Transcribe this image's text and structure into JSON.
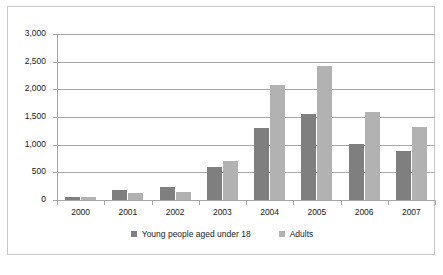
{
  "chart_data": {
    "type": "bar",
    "title": "",
    "subtitle": "",
    "xlabel": "",
    "ylabel": "",
    "categories": [
      "2000",
      "2001",
      "2002",
      "2003",
      "2004",
      "2005",
      "2006",
      "2007"
    ],
    "series": [
      {
        "name": "Young people aged under 18",
        "color": "#7f7f7f",
        "values": [
          60,
          180,
          235,
          605,
          1310,
          1555,
          1015,
          890
        ]
      },
      {
        "name": "Adults",
        "color": "#b2b2b2",
        "values": [
          55,
          135,
          150,
          700,
          2070,
          2430,
          1585,
          1320
        ]
      }
    ],
    "ylim": [
      0,
      3000
    ],
    "yticks": [
      0,
      500,
      1000,
      1500,
      2000,
      2500,
      3000
    ],
    "ytick_labels": [
      "0",
      "500",
      "1,000",
      "1,500",
      "2,000",
      "2,500",
      "3,000"
    ],
    "grid": true,
    "grid_axis": "y",
    "legend_position": "bottom",
    "legend_entries": [
      "Young people aged under 18",
      "Adults"
    ],
    "annotations": []
  },
  "colors": {
    "series_young": "#7f7f7f",
    "series_adults": "#b2b2b2",
    "gridline": "#a6a6a6",
    "axis": "#a6a6a6",
    "frame_border": "#c9c9c9",
    "text": "#1a1a1a",
    "background": "#ffffff"
  }
}
